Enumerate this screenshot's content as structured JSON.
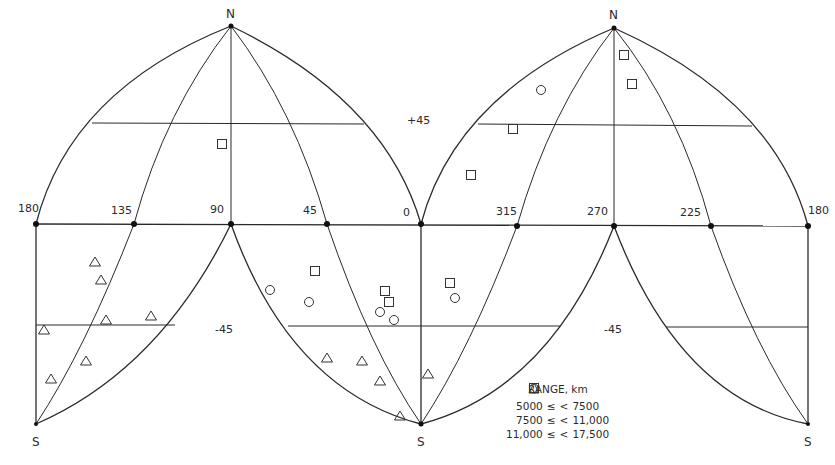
{
  "map": {
    "type": "interrupted sinusoidal-lobed world projection",
    "poles": {
      "north": "N",
      "south": "S"
    },
    "longitude_labels_left_lobe": [
      "180",
      "135",
      "90",
      "45",
      "0"
    ],
    "longitude_labels_right_lobe": [
      "315",
      "270",
      "225",
      "180"
    ],
    "latitude_labels": {
      "north": "+45",
      "south_left": "-45",
      "south_right": "-45"
    },
    "line_color": "#2a2a2a"
  },
  "legend": {
    "title": "RANGE, km",
    "entries": [
      {
        "symbol": "triangle",
        "lower": "5000",
        "op1": "≤",
        "op2": "<",
        "upper": "7500"
      },
      {
        "symbol": "circle",
        "lower": "7500",
        "op1": "≤",
        "op2": "<",
        "upper": "11,000"
      },
      {
        "symbol": "square",
        "lower": "11,000",
        "op1": "≤",
        "op2": "<",
        "upper": "17,500"
      }
    ]
  },
  "markers": [
    {
      "symbol": "square",
      "x": 222,
      "y": 144
    },
    {
      "symbol": "circle",
      "x": 541,
      "y": 90
    },
    {
      "symbol": "square",
      "x": 624,
      "y": 55
    },
    {
      "symbol": "square",
      "x": 632,
      "y": 84
    },
    {
      "symbol": "square",
      "x": 513,
      "y": 129
    },
    {
      "symbol": "square",
      "x": 471,
      "y": 175
    },
    {
      "symbol": "triangle",
      "x": 95,
      "y": 262
    },
    {
      "symbol": "triangle",
      "x": 101,
      "y": 280
    },
    {
      "symbol": "triangle",
      "x": 106,
      "y": 320
    },
    {
      "symbol": "triangle",
      "x": 151,
      "y": 316
    },
    {
      "symbol": "triangle",
      "x": 44,
      "y": 330
    },
    {
      "symbol": "triangle",
      "x": 86,
      "y": 361
    },
    {
      "symbol": "triangle",
      "x": 51,
      "y": 379
    },
    {
      "symbol": "square",
      "x": 315,
      "y": 271
    },
    {
      "symbol": "circle",
      "x": 270,
      "y": 290
    },
    {
      "symbol": "circle",
      "x": 309,
      "y": 302
    },
    {
      "symbol": "square",
      "x": 385,
      "y": 291
    },
    {
      "symbol": "square",
      "x": 389,
      "y": 302
    },
    {
      "symbol": "circle",
      "x": 380,
      "y": 312
    },
    {
      "symbol": "circle",
      "x": 394,
      "y": 320
    },
    {
      "symbol": "square",
      "x": 450,
      "y": 283
    },
    {
      "symbol": "circle",
      "x": 455,
      "y": 298
    },
    {
      "symbol": "triangle",
      "x": 327,
      "y": 358
    },
    {
      "symbol": "triangle",
      "x": 362,
      "y": 361
    },
    {
      "symbol": "triangle",
      "x": 380,
      "y": 381
    },
    {
      "symbol": "triangle",
      "x": 428,
      "y": 374
    },
    {
      "symbol": "triangle",
      "x": 400,
      "y": 416
    }
  ]
}
